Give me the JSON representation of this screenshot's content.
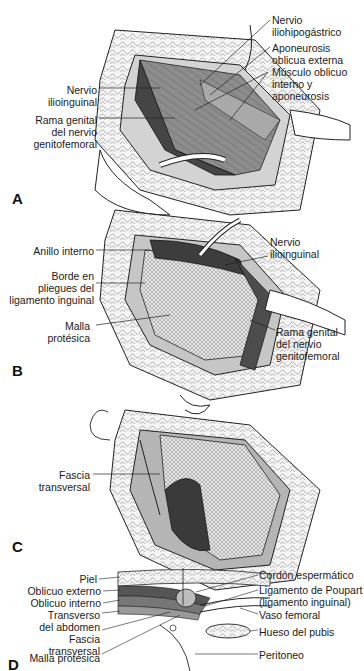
{
  "figure": {
    "panels": [
      {
        "letter": "A",
        "labels": {
          "nervio_iliohipogastrico": "Nervio\niliohipogástrico",
          "aponeurosis_oblicua_externa": "Aponeurosis\noblicua externa",
          "musculo_oblicuo_interno": "Músculo oblicuo\ninterno y\naponeurosis",
          "nervio_ilioinguinal": "Nervio\nilioinguinal",
          "rama_genital": "Rama genital\ndel nervio\ngenitofemoral"
        }
      },
      {
        "letter": "B",
        "labels": {
          "anillo_interno": "Anillo interno",
          "borde_pliegues": "Borde en\npliegues del\nligamento inguinal",
          "malla_protesica": "Malla\nprotésica",
          "nervio_ilioinguinal": "Nervio\nilioinguinal",
          "rama_genital": "Rama genital\ndel nervio\ngenitofemoral"
        }
      },
      {
        "letter": "C",
        "labels": {
          "fascia_transversal": "Fascia\ntransversal"
        }
      },
      {
        "letter": "D",
        "labels": {
          "piel": "Piel",
          "oblicuo_externo": "Oblicuo externo",
          "oblicuo_interno": "Oblicuo interno",
          "transverso": "Transverso\ndel abdomen",
          "fascia_transversal": "Fascia\ntransversal",
          "malla_protesica": "Malla protésica",
          "cordon_espermatico": "Cordón espermático",
          "ligamento_poupart": "Ligamento de Poupart\n(ligamento inguinal)",
          "vaso_femoral": "Vaso femoral",
          "hueso_pubis": "Hueso del pubis",
          "peritoneo": "Peritoneo"
        }
      }
    ]
  },
  "colors": {
    "line": "#222222",
    "dark_muscle": "#4a4a4a",
    "mid_muscle": "#8a8a8a",
    "light_tissue": "#c8c8c8",
    "fat": "#f2f2f2",
    "mesh": "#d9d9d9"
  }
}
